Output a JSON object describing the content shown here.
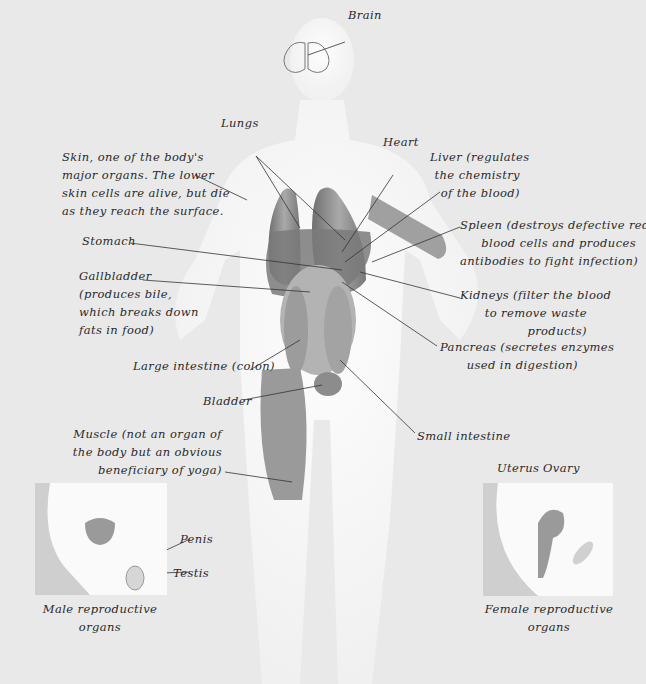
{
  "diagram": {
    "colors": {
      "background": "#e9e9e9",
      "silhouette": "#f4f4f4",
      "organ": "#8a8a8a",
      "line": "#333333",
      "text": "#2a2a2a"
    },
    "labels": {
      "brain": "Brain",
      "lungs": "Lungs",
      "heart": "Heart",
      "liver": [
        "Liver (regulates",
        "the chemistry",
        "of the blood)"
      ],
      "skin": [
        "Skin, one of the body's",
        "major organs. The lower",
        "skin cells are alive, but die",
        "as they reach the surface."
      ],
      "spleen": [
        "Spleen (destroys defective red",
        "blood cells and produces",
        "antibodies to fight infection)"
      ],
      "stomach": "Stomach",
      "gallbladder": [
        "Gallbladder",
        "(produces bile,",
        "which breaks down",
        "fats in food)"
      ],
      "kidneys": [
        "Kidneys (filter the blood",
        "to remove waste",
        "products)"
      ],
      "pancreas": [
        "Pancreas (secretes enzymes",
        "used in digestion)"
      ],
      "large_intestine": "Large intestine (colon)",
      "bladder": "Bladder",
      "small_intestine": "Small intestine",
      "muscle": [
        "Muscle (not an organ of",
        "the body but an obvious",
        "beneficiary of yoga)"
      ],
      "penis": "Penis",
      "testis": "Testis",
      "uterus": "Uterus",
      "ovary": "Ovary",
      "male_caption": [
        "Male reproductive",
        "organs"
      ],
      "female_caption": [
        "Female reproductive",
        "organs"
      ]
    }
  }
}
